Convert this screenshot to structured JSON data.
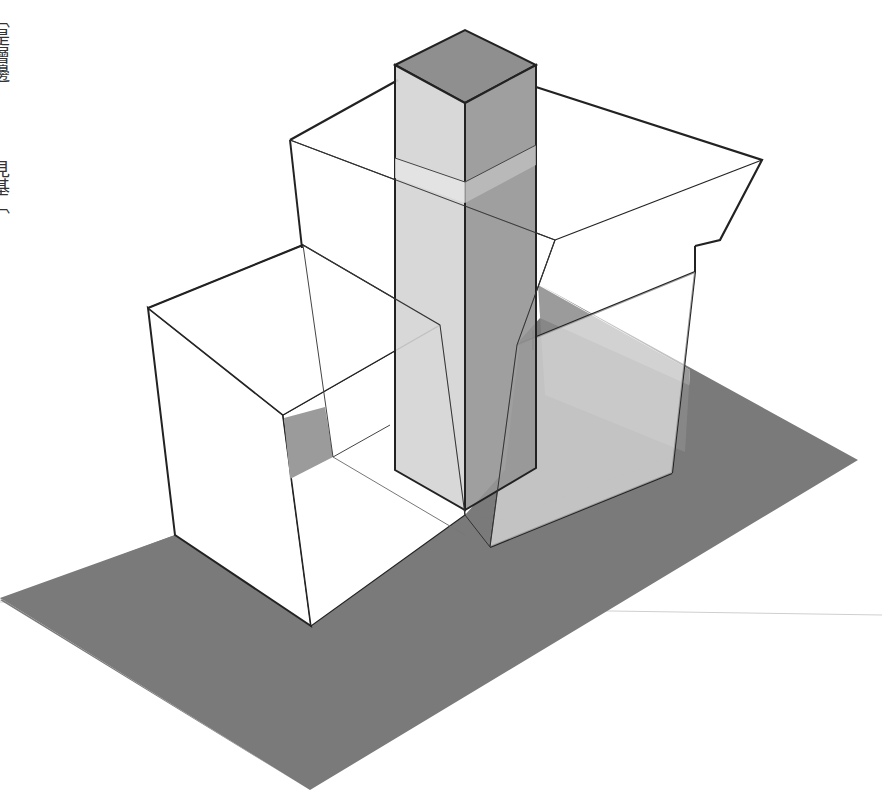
{
  "figure": {
    "side_text_top": "〔是層邊",
    "side_text_bottom": "見基〔",
    "colors": {
      "background": "#ffffff",
      "ground_shadow": "#7a7a7a",
      "tower_top": "#8f8f8f",
      "tower_left": "#d4d4d4",
      "tower_right": "#9a9a9a",
      "outline": "#222222",
      "thin_line": "#444444",
      "inner_shadow": "#9b9b9b"
    }
  }
}
